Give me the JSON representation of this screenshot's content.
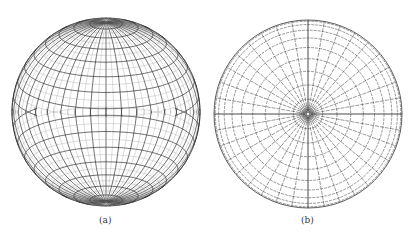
{
  "figures": [
    {
      "id": "a",
      "caption": "(a)",
      "description": "sphere with latitude-longitude grid, poles at top and bottom",
      "meridian_spacing_deg": 10,
      "parallel_spacing_deg": 10
    },
    {
      "id": "b",
      "caption": "(b)",
      "description": "polar-view projection: concentric circles with radial lines converging at center",
      "radial_lines": 36,
      "rings": 10
    }
  ],
  "colors": {
    "line": "#333333",
    "fine": "#999999",
    "background": "#ffffff"
  }
}
